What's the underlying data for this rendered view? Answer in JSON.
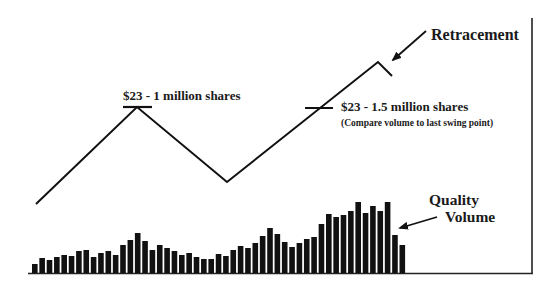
{
  "chart_data": {
    "type": "bar",
    "title": "",
    "xlabel": "",
    "ylabel": "",
    "grid": false,
    "price_line": {
      "points": [
        [
          36,
          204
        ],
        [
          137,
          107
        ],
        [
          227,
          182
        ],
        [
          378,
          62
        ],
        [
          392,
          76
        ]
      ],
      "labels": [
        "start",
        "swing high",
        "swing low",
        "new high",
        "retracement"
      ]
    },
    "volume": {
      "baseline_y": 273,
      "x_start": 32,
      "bar_pitch": 7.35,
      "bar_width": 5.6,
      "heights": [
        9,
        15,
        13,
        16,
        18,
        17,
        22,
        23,
        16,
        20,
        22,
        18,
        28,
        33,
        40,
        32,
        23,
        28,
        25,
        22,
        18,
        20,
        16,
        14,
        14,
        19,
        17,
        23,
        27,
        25,
        30,
        37,
        45,
        39,
        31,
        26,
        30,
        34,
        36,
        49,
        59,
        56,
        58,
        62,
        71,
        60,
        67,
        62,
        71,
        38,
        28
      ],
      "tallest_label": "Quality Volume"
    },
    "annotations": [
      {
        "id": "first-peak",
        "text": "$23 - 1 million shares"
      },
      {
        "id": "second-level",
        "text": "$23 - 1.5 million shares"
      },
      {
        "id": "second-level-note",
        "text": "(Compare volume to last swing point)"
      },
      {
        "id": "retracement",
        "text": "Retracement"
      },
      {
        "id": "quality-line-1",
        "text": "Quality"
      },
      {
        "id": "quality-line-2",
        "text": "Volume"
      }
    ]
  },
  "labels": {
    "first_peak": "$23 - 1 million shares",
    "second_level": "$23 - 1.5 million shares",
    "second_level_note": "(Compare volume to last swing point)",
    "retracement": "Retracement",
    "quality_1": "Quality",
    "quality_2": "Volume"
  },
  "colors": {
    "ink": "#111111",
    "background": "#ffffff"
  }
}
